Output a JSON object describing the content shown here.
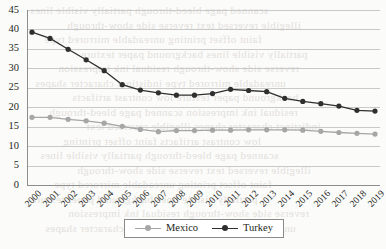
{
  "chart_data": {
    "type": "line",
    "title": "",
    "subtitle": "",
    "xlabel": "",
    "ylabel": "",
    "categories": [
      "2000",
      "2001",
      "2002",
      "2003",
      "2004",
      "2005",
      "2006",
      "2007",
      "2008",
      "2009",
      "2010",
      "2011",
      "2012",
      "2013",
      "2014",
      "2015",
      "2016",
      "2017",
      "2018",
      "2019"
    ],
    "x": [
      2000,
      2001,
      2002,
      2003,
      2004,
      2005,
      2006,
      2007,
      2008,
      2009,
      2010,
      2011,
      2012,
      2013,
      2014,
      2015,
      2016,
      2017,
      2018,
      2019
    ],
    "series": [
      {
        "name": "Mexico",
        "color": "#a6a6a6",
        "marker": "circle",
        "values": [
          17.4,
          17.4,
          16.9,
          16.5,
          15.9,
          15.1,
          14.3,
          13.7,
          14.0,
          14.0,
          14.1,
          14.1,
          14.2,
          14.2,
          14.2,
          14.1,
          13.8,
          13.5,
          13.3,
          13.1
        ]
      },
      {
        "name": "Turkey",
        "color": "#2f2f2f",
        "marker": "circle",
        "values": [
          39.3,
          37.7,
          34.9,
          32.2,
          29.4,
          25.8,
          24.4,
          23.7,
          23.1,
          23.1,
          23.5,
          24.6,
          24.3,
          24.0,
          22.3,
          21.5,
          20.9,
          20.3,
          19.2,
          19.0
        ]
      }
    ],
    "ylim": [
      0,
      45
    ],
    "yticks": [
      0,
      5,
      10,
      15,
      20,
      25,
      30,
      35,
      40,
      45
    ],
    "ytick_labels": [
      "0",
      "5",
      "10",
      "15",
      "20",
      "25",
      "30",
      "35",
      "40",
      "45"
    ],
    "grid": true,
    "grid_axis": "y",
    "legend": {
      "position": "bottom-center",
      "bordered": true,
      "entries": [
        {
          "label": "Mexico",
          "color": "#a6a6a6"
        },
        {
          "label": "Turkey",
          "color": "#2f2f2f"
        }
      ]
    },
    "xtick_rotation": -45
  },
  "background_ghost_text": [
    "scanned page bleed-through",
    "illegible reversed text",
    "faint offset printing",
    "partially visible lines",
    "reverse side show-through",
    "unreadable mirrored type",
    "background paper texture",
    "residual ink impression",
    "indistinct character shapes",
    "low contrast artifacts"
  ]
}
